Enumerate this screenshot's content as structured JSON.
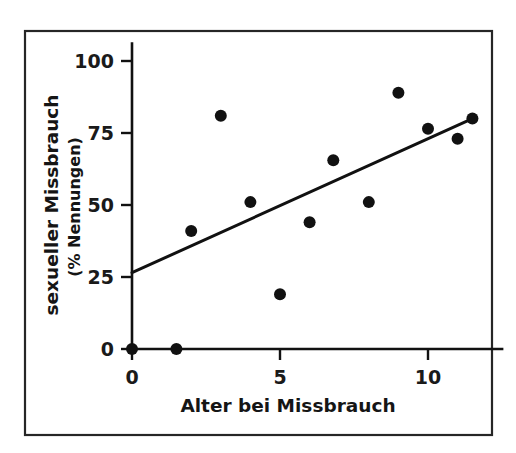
{
  "chart_data": {
    "type": "scatter",
    "title": "",
    "xlabel": "Alter bei Missbrauch",
    "ylabel": "sexueller Missbrauch",
    "ylabel_sub": "(% Nennungen)",
    "xlim": [
      -0.25,
      12.3
    ],
    "ylim": [
      -7,
      105
    ],
    "grid": false,
    "legend": null,
    "x_ticks": [
      {
        "value": 0,
        "label": "0"
      },
      {
        "value": 5,
        "label": "5"
      },
      {
        "value": 10,
        "label": "10"
      }
    ],
    "y_ticks": [
      {
        "value": 0,
        "label": "0"
      },
      {
        "value": 25,
        "label": "25"
      },
      {
        "value": 50,
        "label": "50"
      },
      {
        "value": 75,
        "label": "75"
      },
      {
        "value": 100,
        "label": "100"
      }
    ],
    "points": [
      {
        "x": 0.0,
        "y": 0.0
      },
      {
        "x": 1.5,
        "y": 0.0
      },
      {
        "x": 2.0,
        "y": 41.0
      },
      {
        "x": 3.0,
        "y": 81.0
      },
      {
        "x": 4.0,
        "y": 51.0
      },
      {
        "x": 5.0,
        "y": 19.0
      },
      {
        "x": 6.0,
        "y": 44.0
      },
      {
        "x": 6.8,
        "y": 65.5
      },
      {
        "x": 8.0,
        "y": 51.0
      },
      {
        "x": 9.0,
        "y": 89.0
      },
      {
        "x": 10.0,
        "y": 76.5
      },
      {
        "x": 11.0,
        "y": 73.0
      },
      {
        "x": 11.5,
        "y": 80.0
      }
    ],
    "point_marker": "filled-circle",
    "point_radius_px": 6.0,
    "trend_line": {
      "name": "Regressionsgerade",
      "x_start": 0.0,
      "y_start": 26.5,
      "x_end": 11.5,
      "y_end": 80.0
    },
    "colors": {
      "point": "#111111",
      "line": "#111111",
      "axis": "#111111",
      "frame": "#262626",
      "background": "#ffffff",
      "text": "#1a1a1a"
    }
  }
}
